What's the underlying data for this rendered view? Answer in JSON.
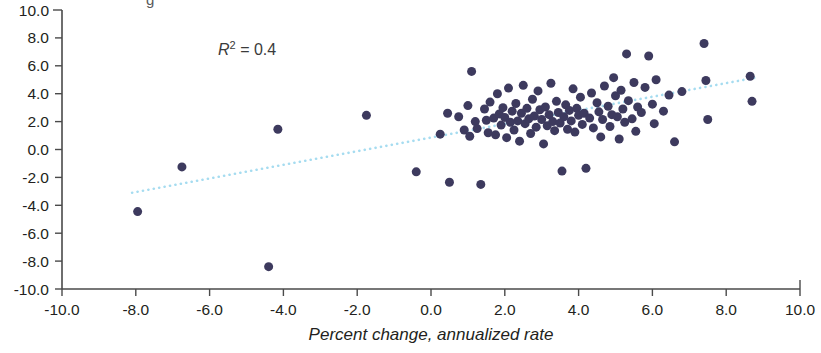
{
  "chart_data": {
    "type": "scatter",
    "title": "",
    "xlabel": "Percent change, annualized rate",
    "ylabel": "",
    "xlim": [
      -10.0,
      10.0
    ],
    "ylim": [
      -10.0,
      10.0
    ],
    "xticks": [
      "-10.0",
      "-8.0",
      "-6.0",
      "-4.0",
      "-2.0",
      "0.0",
      "2.0",
      "4.0",
      "6.0",
      "8.0",
      "10.0"
    ],
    "yticks": [
      "10.0",
      "8.0",
      "6.0",
      "4.0",
      "2.0",
      "0.0",
      "-2.0",
      "-4.0",
      "-6.0",
      "-8.0",
      "-10.0"
    ],
    "xtick_values": [
      -10,
      -8,
      -6,
      -4,
      -2,
      0,
      2,
      4,
      6,
      8,
      10
    ],
    "ytick_values": [
      10,
      8,
      6,
      4,
      2,
      0,
      -2,
      -4,
      -6,
      -8,
      -10
    ],
    "grid": false,
    "legend": null,
    "annotations": [
      {
        "text": "R2 = 0.4",
        "r_symbol": "R",
        "superscript": "2",
        "equals_value": "= 0.4",
        "x": -5.5,
        "y": 7.0
      }
    ],
    "marker": {
      "color": "#3d3a5e",
      "size": 9,
      "shape": "circle"
    },
    "trendline": {
      "color": "#a6dcf0",
      "style": "dotted",
      "x_start": -8.1,
      "x_end": 8.9,
      "y_start": -3.1,
      "y_end": 5.2
    },
    "series": [
      {
        "name": "observations",
        "points": [
          [
            -7.95,
            -4.45
          ],
          [
            -6.75,
            -1.25
          ],
          [
            -4.4,
            -8.4
          ],
          [
            -4.15,
            1.45
          ],
          [
            -1.75,
            2.45
          ],
          [
            -0.4,
            -1.6
          ],
          [
            0.25,
            1.1
          ],
          [
            0.45,
            2.6
          ],
          [
            0.5,
            -2.35
          ],
          [
            0.75,
            2.35
          ],
          [
            0.9,
            1.4
          ],
          [
            1.0,
            3.15
          ],
          [
            1.05,
            0.95
          ],
          [
            1.1,
            5.6
          ],
          [
            1.2,
            2.0
          ],
          [
            1.25,
            1.5
          ],
          [
            1.35,
            -2.5
          ],
          [
            1.45,
            2.9
          ],
          [
            1.5,
            2.1
          ],
          [
            1.55,
            1.2
          ],
          [
            1.6,
            3.4
          ],
          [
            1.7,
            2.25
          ],
          [
            1.75,
            1.05
          ],
          [
            1.8,
            4.0
          ],
          [
            1.85,
            2.55
          ],
          [
            1.9,
            1.75
          ],
          [
            1.95,
            3.0
          ],
          [
            2.0,
            2.3
          ],
          [
            2.05,
            0.85
          ],
          [
            2.1,
            4.4
          ],
          [
            2.15,
            1.95
          ],
          [
            2.2,
            2.75
          ],
          [
            2.25,
            1.4
          ],
          [
            2.3,
            3.3
          ],
          [
            2.35,
            2.05
          ],
          [
            2.4,
            0.6
          ],
          [
            2.45,
            2.6
          ],
          [
            2.5,
            4.6
          ],
          [
            2.55,
            1.85
          ],
          [
            2.6,
            2.95
          ],
          [
            2.65,
            2.2
          ],
          [
            2.7,
            1.15
          ],
          [
            2.75,
            3.6
          ],
          [
            2.8,
            2.4
          ],
          [
            2.85,
            1.6
          ],
          [
            2.9,
            4.2
          ],
          [
            2.95,
            2.85
          ],
          [
            3.0,
            2.15
          ],
          [
            3.05,
            0.4
          ],
          [
            3.1,
            3.05
          ],
          [
            3.15,
            1.7
          ],
          [
            3.2,
            2.5
          ],
          [
            3.25,
            4.75
          ],
          [
            3.3,
            2.0
          ],
          [
            3.35,
            1.35
          ],
          [
            3.4,
            3.45
          ],
          [
            3.45,
            2.65
          ],
          [
            3.5,
            1.9
          ],
          [
            3.55,
            -1.55
          ],
          [
            3.6,
            2.35
          ],
          [
            3.65,
            3.2
          ],
          [
            3.7,
            1.45
          ],
          [
            3.75,
            2.8
          ],
          [
            3.8,
            2.05
          ],
          [
            3.85,
            4.35
          ],
          [
            3.9,
            1.25
          ],
          [
            3.95,
            2.95
          ],
          [
            4.0,
            2.45
          ],
          [
            4.05,
            3.75
          ],
          [
            4.1,
            1.8
          ],
          [
            4.15,
            2.6
          ],
          [
            4.2,
            -1.35
          ],
          [
            4.3,
            2.25
          ],
          [
            4.35,
            4.05
          ],
          [
            4.4,
            1.55
          ],
          [
            4.5,
            3.35
          ],
          [
            4.55,
            2.7
          ],
          [
            4.6,
            0.9
          ],
          [
            4.65,
            2.15
          ],
          [
            4.7,
            4.55
          ],
          [
            4.8,
            3.1
          ],
          [
            4.85,
            1.65
          ],
          [
            4.9,
            2.5
          ],
          [
            4.95,
            5.15
          ],
          [
            5.0,
            3.85
          ],
          [
            5.05,
            2.35
          ],
          [
            5.1,
            0.75
          ],
          [
            5.15,
            4.25
          ],
          [
            5.2,
            2.9
          ],
          [
            5.25,
            1.95
          ],
          [
            5.3,
            6.85
          ],
          [
            5.35,
            3.5
          ],
          [
            5.45,
            2.2
          ],
          [
            5.5,
            4.8
          ],
          [
            5.55,
            1.3
          ],
          [
            5.6,
            3.05
          ],
          [
            5.7,
            2.65
          ],
          [
            5.8,
            4.45
          ],
          [
            5.9,
            6.7
          ],
          [
            6.0,
            3.25
          ],
          [
            6.05,
            1.85
          ],
          [
            6.1,
            5.0
          ],
          [
            6.3,
            2.75
          ],
          [
            6.45,
            3.9
          ],
          [
            6.6,
            0.55
          ],
          [
            6.8,
            4.15
          ],
          [
            7.4,
            7.6
          ],
          [
            7.45,
            4.95
          ],
          [
            7.5,
            2.15
          ],
          [
            8.65,
            5.25
          ],
          [
            8.7,
            3.45
          ]
        ]
      }
    ]
  },
  "axis_label": {
    "text": "Percent change, annualized rate"
  },
  "r_squared": {
    "prefix": "R",
    "sup": "2",
    "suffix": " = 0.4"
  },
  "colors": {
    "marker": "#3d3a5e",
    "trendline": "#a6dcf0",
    "axis": "#4a4a4a",
    "text": "#231f20"
  },
  "top_cropped_text": {
    "text": "g"
  }
}
